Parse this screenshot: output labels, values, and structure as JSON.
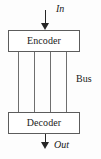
{
  "diagram": {
    "type": "block-diagram",
    "canvas": {
      "width": 101,
      "height": 159,
      "background": "#fdfdfd"
    },
    "blocks": [
      {
        "id": "encoder",
        "label": "Encoder",
        "x": 8,
        "y": 30,
        "width": 72,
        "height": 22,
        "border_color": "#5c5c5c",
        "fill_color": "#ffffff"
      },
      {
        "id": "decoder",
        "label": "Decoder",
        "x": 8,
        "y": 112,
        "width": 72,
        "height": 22,
        "border_color": "#5c5c5c",
        "fill_color": "#ffffff"
      }
    ],
    "arrows": [
      {
        "id": "arrow-in",
        "label": "In",
        "direction": "down",
        "from": "external",
        "to": "encoder",
        "x": 45,
        "y_start": 10,
        "y_end": 30,
        "color": "#262626"
      },
      {
        "id": "arrow-out",
        "label": "Out",
        "direction": "down",
        "from": "decoder",
        "to": "external",
        "x": 45,
        "y_start": 134,
        "y_end": 149,
        "color": "#262626"
      }
    ],
    "bus": {
      "label": "Bus",
      "line_count": 4,
      "line_x_positions": [
        18,
        34,
        50,
        66
      ],
      "y_start": 52,
      "y_end": 112,
      "color": "#6e6e6e",
      "label_x": 76,
      "label_y": 74
    }
  }
}
